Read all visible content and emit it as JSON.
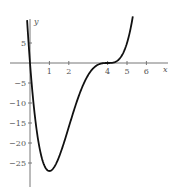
{
  "chart_data": {
    "type": "line",
    "title": "",
    "xlabel": "x",
    "ylabel": "y",
    "function": "y = x(x-4)^3",
    "x_ticks": [
      1,
      2,
      4,
      5,
      6
    ],
    "x_tick_labels": [
      "1",
      "2",
      "4",
      "5",
      "6"
    ],
    "y_ticks": [
      5,
      -5,
      -10,
      -15,
      -20,
      -25
    ],
    "y_tick_labels": [
      "5",
      "−5",
      "−10",
      "−15",
      "−20",
      "−25"
    ],
    "xlim": [
      -1,
      7
    ],
    "ylim": [
      -31,
      11
    ],
    "grid": false,
    "series": [
      {
        "name": "curve",
        "x": [
          -0.15,
          0,
          0.5,
          1,
          1.5,
          2,
          2.5,
          3,
          3.5,
          4,
          4.5,
          5,
          5.3
        ],
        "y": [
          10.7,
          0,
          -21.4,
          -27,
          -23.4,
          -16,
          -8.4,
          -3,
          -0.4,
          0,
          0.6,
          5,
          11.6
        ]
      }
    ],
    "annotations": {
      "minimum": {
        "x": 1,
        "y": -27
      },
      "roots": [
        0,
        4
      ]
    }
  }
}
